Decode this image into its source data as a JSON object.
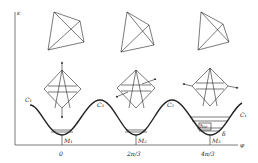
{
  "diagram": {
    "y_axis_label": "ε",
    "x_axis_label": "φ",
    "x_ticks": [
      "0",
      "2π/3",
      "4π/3"
    ],
    "minima_labels": [
      "M₁",
      "M₂",
      "M₃"
    ],
    "curve_labels": [
      "C₁",
      "C₃",
      "C₂",
      "C₁"
    ],
    "inset_labels": {
      "quantum": "ħω",
      "splitting": "δ"
    },
    "colors": {
      "ink": "#222222",
      "background": "#ffffff"
    }
  }
}
